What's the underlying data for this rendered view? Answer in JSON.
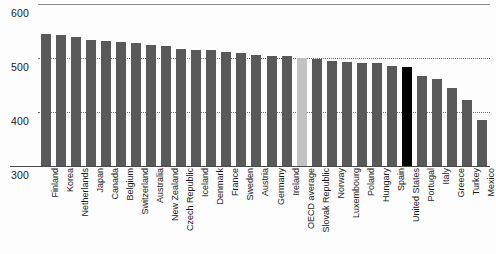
{
  "chart_data": {
    "type": "bar",
    "title": "",
    "xlabel": "",
    "ylabel": "",
    "ylim": [
      300,
      600
    ],
    "yticks": [
      300,
      400,
      500,
      600
    ],
    "grid": "horizontal dotted at 400 and 500, solid at 600",
    "legend": "none",
    "colors": {
      "bar": "#595959",
      "oecd_average": "#c2c2c2",
      "highlight_united_states": "#000000",
      "background": "#ffffff",
      "gridline": "#6f6f6f",
      "axis": "#4a4a4a"
    },
    "categories": [
      "Finland",
      "Korea",
      "Netherlands",
      "Japan",
      "Canada",
      "Belgium",
      "Switzerland",
      "Australia",
      "New Zealand",
      "Czech Republic",
      "Iceland",
      "Denmark",
      "France",
      "Sweden",
      "Austria",
      "Germany",
      "Ireland",
      "OECD average",
      "Slovak Republic",
      "Norway",
      "Luxembourg",
      "Poland",
      "Hungary",
      "Spain",
      "United States",
      "Portugal",
      "Italy",
      "Greece",
      "Turkey",
      "Mexico"
    ],
    "values": [
      544,
      542,
      538,
      534,
      532,
      529,
      527,
      524,
      522,
      516,
      515,
      514,
      511,
      509,
      506,
      504,
      503,
      500,
      498,
      495,
      493,
      490,
      490,
      485,
      483,
      466,
      462,
      445,
      423,
      385
    ],
    "series": [
      {
        "name": "Mathematics performance score",
        "values": [
          544,
          542,
          538,
          534,
          532,
          529,
          527,
          524,
          522,
          516,
          515,
          514,
          511,
          509,
          506,
          504,
          503,
          500,
          498,
          495,
          493,
          490,
          490,
          485,
          483,
          466,
          462,
          445,
          423,
          385
        ]
      }
    ],
    "bar_styles": [
      "bar",
      "bar",
      "bar",
      "bar",
      "bar",
      "bar",
      "bar",
      "bar",
      "bar",
      "bar",
      "bar",
      "bar",
      "bar",
      "bar",
      "bar",
      "bar",
      "bar",
      "oecd",
      "bar",
      "bar",
      "bar",
      "bar",
      "bar",
      "bar",
      "highlight",
      "bar",
      "bar",
      "bar",
      "bar",
      "bar"
    ]
  },
  "yticks": {
    "t600": "600",
    "t500": "500",
    "t400": "400",
    "t300": "300"
  }
}
